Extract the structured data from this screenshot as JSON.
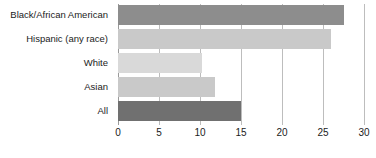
{
  "chart_data": {
    "type": "bar",
    "orientation": "horizontal",
    "title": "",
    "subtitle": "",
    "xlabel": "",
    "ylabel": "",
    "xlim": [
      0,
      30
    ],
    "xticks": [
      0,
      5,
      10,
      15,
      20,
      25,
      30
    ],
    "xtick_labels": [
      "0",
      "5",
      "10",
      "15",
      "20",
      "25",
      "30"
    ],
    "grid": true,
    "legend": false,
    "legend_position": "none",
    "categories": [
      "Black/African American",
      "Hispanic (any race)",
      "White",
      "Asian",
      "All"
    ],
    "values": [
      27.5,
      26.0,
      10.3,
      11.8,
      15.0
    ],
    "bar_colors": [
      "#8d8d8d",
      "#c9c9c9",
      "#d9d9d9",
      "#c9c9c9",
      "#707070"
    ],
    "series": [
      {
        "name": "",
        "values": [
          27.5,
          26.0,
          10.3,
          11.8,
          15.0
        ]
      }
    ]
  },
  "colors": {
    "background": "#ffffff",
    "gridline": "#bdbdbd",
    "axis": "#9a9a9a",
    "text": "#1b1b1b"
  },
  "category_labels": {
    "0": "Black/African American",
    "1": "Hispanic (any race)",
    "2": "White",
    "3": "Asian",
    "4": "All"
  },
  "tick_labels": {
    "0": "0",
    "1": "5",
    "2": "10",
    "3": "15",
    "4": "20",
    "5": "25",
    "6": "30"
  }
}
